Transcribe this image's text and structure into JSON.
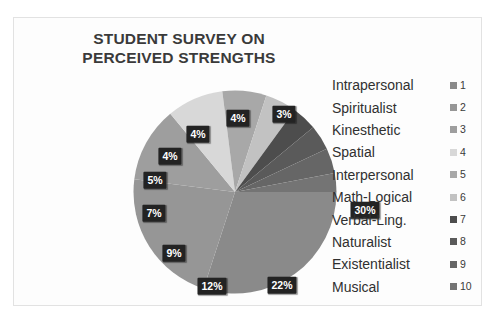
{
  "card": {
    "background_color": "#fdfdfd",
    "border_color": "#e2e2e2"
  },
  "title": {
    "line1": "STUDENT SURVEY ON",
    "line2": "PERCEIVED STRENGTHS",
    "color": "#3a3a3a"
  },
  "legend": {
    "position": "right",
    "items": [
      {
        "label": "Intrapersonal",
        "index": "1",
        "color": "#8a8a8a"
      },
      {
        "label": "Spiritualist",
        "index": "2",
        "color": "#969696"
      },
      {
        "label": "Kinesthetic",
        "index": "3",
        "color": "#9e9e9e"
      },
      {
        "label": "Spatial",
        "index": "4",
        "color": "#d8d8d8"
      },
      {
        "label": "Interpersonal",
        "index": "5",
        "color": "#a8a8a8"
      },
      {
        "label": "Math-Logical",
        "index": "6",
        "color": "#c2c2c2"
      },
      {
        "label": "Verbal-Ling.",
        "index": "7",
        "color": "#4d4d4d"
      },
      {
        "label": "Naturalist",
        "index": "8",
        "color": "#5a5a5a"
      },
      {
        "label": "Existentialist",
        "index": "9",
        "color": "#666666"
      },
      {
        "label": "Musical",
        "index": "10",
        "color": "#747474"
      }
    ]
  },
  "chart_data": {
    "type": "pie",
    "title": "STUDENT SURVEY ON PERCEIVED STRENGTHS",
    "legend_position": "right",
    "value_unit": "percent",
    "start_angle_deg": 0,
    "direction": "clockwise",
    "categories": [
      "Intrapersonal",
      "Spiritualist",
      "Kinesthetic",
      "Spatial",
      "Interpersonal",
      "Math-Logical",
      "Verbal-Ling.",
      "Naturalist",
      "Existentialist",
      "Musical"
    ],
    "values": [
      30,
      22,
      12,
      9,
      7,
      5,
      4,
      4,
      4,
      3
    ],
    "labels": [
      "30%",
      "22%",
      "12%",
      "9%",
      "7%",
      "5%",
      "4%",
      "4%",
      "4%",
      "3%"
    ],
    "colors": [
      "#8a8a8a",
      "#969696",
      "#9e9e9e",
      "#d8d8d8",
      "#a8a8a8",
      "#c2c2c2",
      "#4d4d4d",
      "#5a5a5a",
      "#666666",
      "#747474"
    ],
    "data_label_style": {
      "background": "#232323",
      "text_color": "#ffffff"
    }
  },
  "label_positions": [
    {
      "text": "30%",
      "x": 232,
      "y": 120
    },
    {
      "text": "22%",
      "x": 149,
      "y": 195
    },
    {
      "text": "12%",
      "x": 79,
      "y": 196
    },
    {
      "text": "9%",
      "x": 41,
      "y": 163
    },
    {
      "text": "7%",
      "x": 21,
      "y": 123
    },
    {
      "text": "5%",
      "x": 22,
      "y": 90
    },
    {
      "text": "4%",
      "x": 37,
      "y": 66
    },
    {
      "text": "4%",
      "x": 65,
      "y": 44
    },
    {
      "text": "4%",
      "x": 105,
      "y": 28
    },
    {
      "text": "3%",
      "x": 151,
      "y": 24
    }
  ]
}
